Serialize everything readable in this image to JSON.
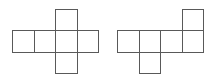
{
  "figure": {
    "canvas": {
      "width": 215,
      "height": 74
    },
    "background_color": "#ffffff",
    "stroke_color": "#595959",
    "fill_color": "#ffffff",
    "stroke_width": 1,
    "cell_size": 21.5,
    "diagrams": [
      {
        "id": "left-net",
        "label": "Left cube net",
        "description": "Horizontal row of four squares with one square attached above the third column and one square attached below the third column",
        "origin": {
          "x": 12,
          "y": 30
        },
        "grid_columns": 4,
        "grid_rows": 3,
        "cells": [
          {
            "name": "cell-row-1",
            "col": 0,
            "row": 1,
            "x": 12.0,
            "y": 30.0,
            "w": 21.5,
            "h": 21.5
          },
          {
            "name": "cell-row-2",
            "col": 1,
            "row": 1,
            "x": 33.5,
            "y": 30.0,
            "w": 21.5,
            "h": 21.5
          },
          {
            "name": "cell-row-3",
            "col": 2,
            "row": 1,
            "x": 55.0,
            "y": 30.0,
            "w": 21.5,
            "h": 21.5
          },
          {
            "name": "cell-row-4",
            "col": 3,
            "row": 1,
            "x": 76.5,
            "y": 30.0,
            "w": 21.5,
            "h": 21.5
          },
          {
            "name": "cell-top",
            "col": 2,
            "row": 0,
            "x": 55.0,
            "y": 8.5,
            "w": 21.5,
            "h": 21.5
          },
          {
            "name": "cell-bottom",
            "col": 2,
            "row": 2,
            "x": 55.0,
            "y": 51.5,
            "w": 21.5,
            "h": 21.5
          }
        ]
      },
      {
        "id": "right-net",
        "label": "Right cube net",
        "description": "Horizontal row of four squares with one square attached above the fourth column and one square attached below the second column",
        "origin": {
          "x": 117,
          "y": 30
        },
        "grid_columns": 4,
        "grid_rows": 3,
        "cells": [
          {
            "name": "cell-row-1",
            "col": 0,
            "row": 1,
            "x": 117.0,
            "y": 30.0,
            "w": 21.5,
            "h": 21.5
          },
          {
            "name": "cell-row-2",
            "col": 1,
            "row": 1,
            "x": 138.5,
            "y": 30.0,
            "w": 21.5,
            "h": 21.5
          },
          {
            "name": "cell-row-3",
            "col": 2,
            "row": 1,
            "x": 160.0,
            "y": 30.0,
            "w": 21.5,
            "h": 21.5
          },
          {
            "name": "cell-row-4",
            "col": 3,
            "row": 1,
            "x": 181.5,
            "y": 30.0,
            "w": 21.5,
            "h": 21.5
          },
          {
            "name": "cell-top",
            "col": 3,
            "row": 0,
            "x": 181.5,
            "y": 8.5,
            "w": 21.5,
            "h": 21.5
          },
          {
            "name": "cell-bottom",
            "col": 1,
            "row": 2,
            "x": 138.5,
            "y": 51.5,
            "w": 21.5,
            "h": 21.5
          }
        ]
      }
    ]
  }
}
